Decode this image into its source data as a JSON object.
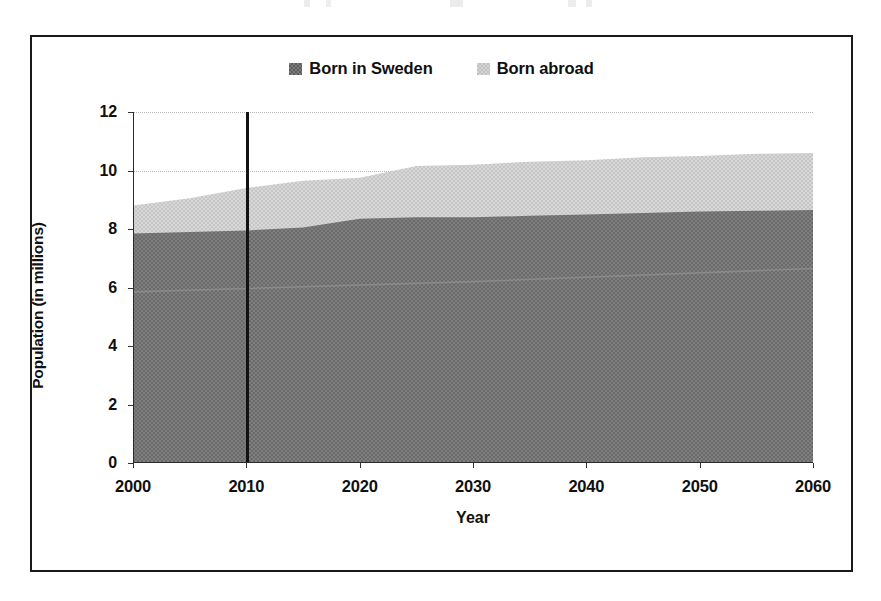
{
  "chart_data": {
    "type": "area",
    "title": "",
    "subtitle": "",
    "xlabel": "Year",
    "ylabel": "Population (in millions)",
    "stacked": true,
    "grid": true,
    "legend_position": "top-center",
    "xlim": [
      2000,
      2060
    ],
    "ylim": [
      0,
      12
    ],
    "x_ticks": [
      2000,
      2010,
      2020,
      2030,
      2040,
      2050,
      2060
    ],
    "y_ticks": [
      0,
      2,
      4,
      6,
      8,
      10,
      12
    ],
    "x_tick_labels": [
      "2000",
      "2010",
      "2020",
      "2030",
      "2040",
      "2050",
      "2060"
    ],
    "y_tick_labels": [
      "0",
      "2",
      "4",
      "6",
      "8",
      "10",
      "12"
    ],
    "x": [
      2000,
      2005,
      2010,
      2015,
      2020,
      2025,
      2030,
      2035,
      2040,
      2045,
      2050,
      2055,
      2060
    ],
    "series": [
      {
        "name": "Born in Sweden",
        "color": "#7b7b7b",
        "values": [
          7.85,
          7.9,
          7.95,
          8.05,
          8.35,
          8.4,
          8.4,
          8.45,
          8.5,
          8.55,
          8.6,
          8.62,
          8.65
        ]
      },
      {
        "name": "Born abroad",
        "color": "#d3d3d3",
        "values": [
          0.95,
          1.15,
          1.45,
          1.6,
          1.4,
          1.75,
          1.8,
          1.85,
          1.85,
          1.9,
          1.9,
          1.95,
          1.95
        ]
      }
    ],
    "totals": [
      8.8,
      9.05,
      9.4,
      9.65,
      9.75,
      10.15,
      10.2,
      10.3,
      10.35,
      10.45,
      10.5,
      10.57,
      10.6
    ],
    "annotations": [
      {
        "type": "vertical-line",
        "name": "current-year-marker",
        "x": 2010,
        "color": "#121212",
        "label": ""
      }
    ]
  },
  "legend": {
    "items": [
      {
        "label": "Born in Sweden",
        "swatch": "legend-swatch-sweden"
      },
      {
        "label": "Born abroad",
        "swatch": "legend-swatch-abroad"
      }
    ]
  },
  "colors": {
    "born_in_sweden": "#7b7b7b",
    "born_abroad": "#d3d3d3",
    "marker_line": "#121212",
    "axis": "#2a2a2a",
    "gridline": "#b4b4b4",
    "frame": "#1a1a1a",
    "background": "#ffffff"
  }
}
